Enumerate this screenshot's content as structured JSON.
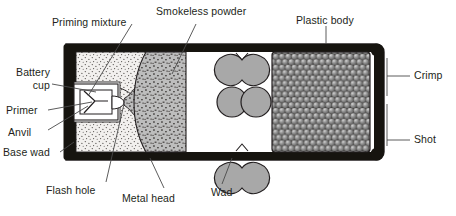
{
  "diagram": {
    "labels": [
      {
        "key": "priming_mixture",
        "text": "Priming mixture"
      },
      {
        "key": "smokeless_powder",
        "text": "Smokeless powder"
      },
      {
        "key": "plastic_body",
        "text": "Plastic body"
      },
      {
        "key": "battery_cup_line1",
        "text": "Battery"
      },
      {
        "key": "battery_cup_line2",
        "text": "cup"
      },
      {
        "key": "primer",
        "text": "Primer"
      },
      {
        "key": "anvil",
        "text": "Anvil"
      },
      {
        "key": "base_wad",
        "text": "Base wad"
      },
      {
        "key": "flash_hole",
        "text": "Flash hole"
      },
      {
        "key": "metal_head",
        "text": "Metal head"
      },
      {
        "key": "wad",
        "text": "Wad"
      },
      {
        "key": "crimp",
        "text": "Crimp"
      },
      {
        "key": "shot",
        "text": "Shot"
      }
    ],
    "colors": {
      "outline": "#231f20",
      "shell_wall": "#1a1a1a",
      "base_wad_fill": "#f2f0ee",
      "powder_fill": "#b9b9b9",
      "wad_fill": "#a8a8a8",
      "shot_fill": "#8a8a8a",
      "background": "#ffffff",
      "leader": "#4a4a4a"
    }
  }
}
